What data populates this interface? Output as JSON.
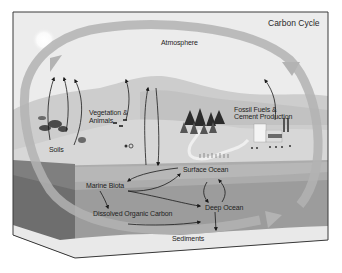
{
  "diagram": {
    "title": "Carbon Cycle",
    "colors": {
      "frame": "#3c3c3c",
      "sky": "#ebebeb",
      "hills": "#c9c9c9",
      "land": "#d6d6d6",
      "surface_ocean": "#a9a9a9",
      "deep_ocean": "#9a9a9a",
      "side_face": "#7d7d7d",
      "bottom_face": "#ededed",
      "cycle_arrow": "#b0b0b0",
      "flux_arrow": "#1a1a1a"
    },
    "labels": {
      "atmosphere": "Atmosphere",
      "vegetation_line1": "Vegetation &",
      "vegetation_line2": "Animals",
      "soils": "Soils",
      "fossil_line1": "Fossil Fuels &",
      "fossil_line2": "Cement Production",
      "surface_ocean": "Surface Ocean",
      "marine_biota": "Marine Biota",
      "deep_ocean": "Deep Ocean",
      "dissolved_organic_carbon": "Dissolved Organic Carbon",
      "sediments": "Sediments"
    }
  }
}
